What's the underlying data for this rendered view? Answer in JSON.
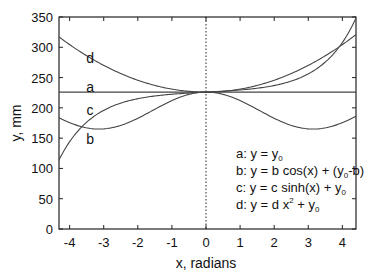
{
  "chart_data": {
    "type": "line",
    "title": "",
    "xlabel": "x, radians",
    "ylabel": "y, mm",
    "xlim": [
      -4.4,
      4.4
    ],
    "ylim": [
      0,
      350
    ],
    "xticks": [
      -4,
      -3,
      -2,
      -1,
      0,
      1,
      2,
      3,
      4
    ],
    "xtick_labels": [
      "-4",
      "-3",
      "-2",
      "-1",
      "0",
      "1",
      "2",
      "3",
      "4"
    ],
    "yticks": [
      0,
      50,
      100,
      150,
      200,
      250,
      300,
      350
    ],
    "ytick_labels": [
      "0",
      "50",
      "100",
      "150",
      "200",
      "250",
      "300",
      "350"
    ],
    "grid": false,
    "vertical_reference_line": {
      "x": 0,
      "style": "dotted"
    },
    "parameters": {
      "y0": 226,
      "b": 30.5,
      "c": 3.0,
      "d": 4.9
    },
    "series": [
      {
        "name": "a",
        "formula": "y = y0",
        "x": [
          -4.4,
          -3,
          -2,
          -1,
          0,
          1,
          2,
          3,
          4.4
        ],
        "values": [
          226,
          226,
          226,
          226,
          226,
          226,
          226,
          226,
          226
        ]
      },
      {
        "name": "b",
        "formula": "y = b cos(x) + (y0-b)",
        "x": [
          -4.4,
          -3,
          -2,
          -1,
          0,
          1,
          2,
          3,
          4.4
        ],
        "values": [
          186,
          165,
          183,
          212,
          226,
          212,
          183,
          165,
          186
        ]
      },
      {
        "name": "c",
        "formula": "y = c sinh(x) + y0",
        "x": [
          -4.4,
          -3,
          -2,
          -1,
          0,
          1,
          2,
          3,
          4.4
        ],
        "values": [
          104,
          196,
          215,
          222,
          226,
          230,
          237,
          256,
          348
        ]
      },
      {
        "name": "d",
        "formula": "y = d x^2 + y0",
        "x": [
          -4.4,
          -3,
          -2,
          -1,
          0,
          1,
          2,
          3,
          4.4
        ],
        "values": [
          321,
          270,
          246,
          231,
          226,
          231,
          246,
          270,
          321
        ]
      }
    ],
    "curve_labels": [
      {
        "text": "d",
        "x": -3.4,
        "y": 283
      },
      {
        "text": "a",
        "x": -3.4,
        "y": 234
      },
      {
        "text": "c",
        "x": -3.4,
        "y": 197
      },
      {
        "text": "b",
        "x": -3.4,
        "y": 148
      }
    ],
    "legend": {
      "position": "lower right (inside)",
      "entries": [
        {
          "key": "a:",
          "text": "y = y",
          "sub": "0",
          "tail": ""
        },
        {
          "key": "b:",
          "text": "y = b cos(x) + (y",
          "sub": "0",
          "tail": "-b)"
        },
        {
          "key": "c:",
          "text": "y = c sinh(x) + y",
          "sub": "0",
          "tail": ""
        },
        {
          "key": "d:",
          "text": "y = d x",
          "sup": "2",
          "text2": " + y",
          "sub": "0",
          "tail": ""
        }
      ]
    },
    "colors": {
      "curves": "#444444",
      "axes": "#222222",
      "text": "#111111",
      "background": "#ffffff"
    }
  }
}
